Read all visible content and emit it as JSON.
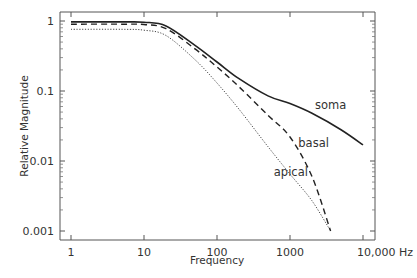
{
  "chart_data": {
    "type": "line",
    "title": "",
    "xlabel": "Frequency",
    "ylabel": "Relative Magnitude",
    "xscale": "log",
    "yscale": "log",
    "xlim": [
      0.85,
      14000
    ],
    "ylim": [
      0.0008,
      1.35
    ],
    "xticks": [
      1,
      10,
      100,
      1000,
      10000
    ],
    "xtick_labels": [
      "1",
      "10",
      "100",
      "1000",
      "10,000 Hz"
    ],
    "yticks": [
      1,
      0.1,
      0.01,
      0.001
    ],
    "ytick_labels": [
      "1",
      "0.1",
      "0.01",
      "0.001"
    ],
    "grid": false,
    "legend": "inline labels",
    "series": [
      {
        "name": "soma",
        "style": "solid",
        "x": [
          1,
          5,
          10,
          20,
          50,
          100,
          200,
          500,
          1000,
          2000,
          5000,
          10000
        ],
        "values": [
          0.97,
          0.97,
          0.96,
          0.85,
          0.45,
          0.26,
          0.15,
          0.085,
          0.066,
          0.048,
          0.028,
          0.017
        ]
      },
      {
        "name": "basal",
        "style": "dashed",
        "x": [
          1,
          5,
          10,
          20,
          50,
          100,
          200,
          500,
          1000,
          2000,
          3600
        ],
        "values": [
          0.9,
          0.9,
          0.89,
          0.78,
          0.4,
          0.22,
          0.115,
          0.045,
          0.022,
          0.006,
          0.001
        ]
      },
      {
        "name": "apical",
        "style": "dotted",
        "x": [
          1,
          5,
          10,
          20,
          50,
          100,
          200,
          500,
          1000,
          2000,
          3600
        ],
        "values": [
          0.76,
          0.76,
          0.74,
          0.62,
          0.28,
          0.13,
          0.055,
          0.016,
          0.0065,
          0.0027,
          0.001
        ]
      }
    ],
    "annotations": [
      {
        "text": "soma",
        "x": 2200,
        "y": 0.055
      },
      {
        "text": "basal",
        "x": 1300,
        "y": 0.016
      },
      {
        "text": "apical",
        "x": 600,
        "y": 0.0062
      }
    ]
  }
}
